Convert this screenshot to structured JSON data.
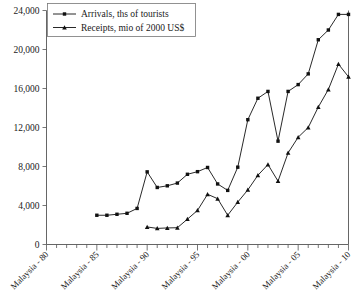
{
  "chart_data": {
    "type": "line",
    "title": "",
    "xlabel": "",
    "ylabel": "",
    "ylim": [
      0,
      24000
    ],
    "xlim": [
      1980,
      2010
    ],
    "grid": false,
    "legend_position": "top-left",
    "y_ticks": [
      "0",
      "4,000",
      "8,000",
      "12,000",
      "16,000",
      "20,000",
      "24,000"
    ],
    "y_tick_values": [
      0,
      4000,
      8000,
      12000,
      16000,
      20000,
      24000
    ],
    "x_tick_labels": [
      "Malaysia - 80",
      "Malaysia - 85",
      "Malaysia - 90",
      "Malaysia - 95",
      "Malaysia - 00",
      "Malaysia - 05",
      "Malaysia - 10"
    ],
    "x_tick_years": [
      1980,
      1985,
      1990,
      1995,
      2000,
      2005,
      2010
    ],
    "x_minor_years": [
      1981,
      1982,
      1983,
      1984,
      1986,
      1987,
      1988,
      1989,
      1991,
      1992,
      1993,
      1994,
      1996,
      1997,
      1998,
      1999,
      2001,
      2002,
      2003,
      2004,
      2006,
      2007,
      2008,
      2009
    ],
    "x": [
      1985,
      1986,
      1987,
      1988,
      1989,
      1990,
      1991,
      1992,
      1993,
      1994,
      1995,
      1996,
      1997,
      1998,
      1999,
      2000,
      2001,
      2002,
      2003,
      2004,
      2005,
      2006,
      2007,
      2008,
      2009,
      2010
    ],
    "series": [
      {
        "name": "Arrivals, ths of tourists",
        "marker": "square",
        "color": "#111111",
        "x": [
          1985,
          1986,
          1987,
          1988,
          1989,
          1990,
          1991,
          1992,
          1993,
          1994,
          1995,
          1996,
          1997,
          1998,
          1999,
          2000,
          2001,
          2002,
          2003,
          2004,
          2005,
          2006,
          2007,
          2008,
          2009,
          2010
        ],
        "values": [
          3000,
          3000,
          3100,
          3200,
          3700,
          7450,
          5850,
          6020,
          6300,
          7200,
          7470,
          7900,
          6210,
          5550,
          7930,
          12800,
          15000,
          15700,
          10600,
          15700,
          16400,
          17500,
          21000,
          22000,
          23600,
          23600
        ]
      },
      {
        "name": "Receipts, mio of 2000 US$",
        "marker": "triangle",
        "color": "#111111",
        "x": [
          1990,
          1991,
          1992,
          1993,
          1994,
          1995,
          1996,
          1997,
          1998,
          1999,
          2000,
          2001,
          2002,
          2003,
          2004,
          2005,
          2006,
          2007,
          2008,
          2009,
          2010
        ],
        "values": [
          1800,
          1650,
          1700,
          1720,
          2600,
          3500,
          5150,
          4700,
          3000,
          4350,
          5600,
          7100,
          8200,
          6500,
          9400,
          11000,
          12000,
          14100,
          15900,
          18500,
          17200
        ]
      }
    ]
  },
  "legend": {
    "items": [
      {
        "label": "Arrivals, ths of tourists",
        "marker": "square"
      },
      {
        "label": "Receipts, mio of 2000 US$",
        "marker": "triangle"
      }
    ]
  }
}
